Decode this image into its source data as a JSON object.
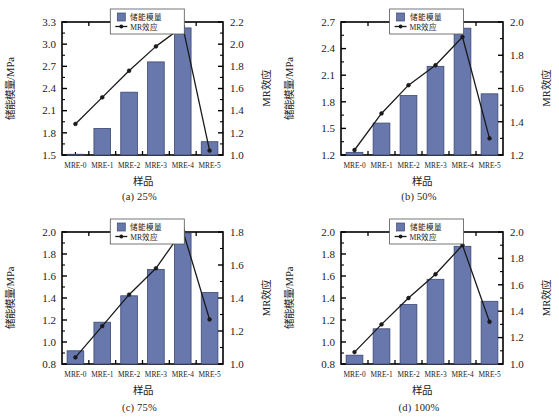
{
  "figure": {
    "panel_count": 4,
    "bar_color": "#6878AD",
    "bar_edge_color": "#3B4770",
    "line_color": "#1a1a1a",
    "axis_color": "#000000",
    "background": "#ffffff"
  },
  "legend": {
    "bar_label": "储能模量",
    "line_label": "MR效应"
  },
  "axes_titles": {
    "y_left": "储能模量/MPa",
    "y_right": "MR效应",
    "x": "样品"
  },
  "chart_data": [
    {
      "type": "bar",
      "id": "panel-a",
      "title": "(a) 25%",
      "caption": "(a) 25%",
      "xlabel": "样品",
      "ylabel": "储能模量/MPa",
      "y2label": "MR效应",
      "categories": [
        "MRE-0",
        "MRE-1",
        "MRE-2",
        "MRE-3",
        "MRE-4",
        "MRE-5"
      ],
      "ylim": [
        1.5,
        3.3
      ],
      "yticks": [
        "1.5",
        "1.8",
        "2.1",
        "2.4",
        "2.7",
        "3.0",
        "3.3"
      ],
      "y2lim": [
        1.0,
        2.2
      ],
      "y2ticks": [
        "1.0",
        "1.2",
        "1.4",
        "1.6",
        "1.8",
        "2.0",
        "2.2"
      ],
      "grid": false,
      "legend_position": "top-center",
      "series": [
        {
          "name": "储能模量",
          "kind": "bar",
          "axis": "left",
          "values": [
            1.51,
            1.86,
            2.35,
            2.76,
            3.22,
            1.68
          ]
        },
        {
          "name": "MR效应",
          "kind": "line",
          "axis": "right",
          "values": [
            1.28,
            1.52,
            1.76,
            1.98,
            2.16,
            1.04
          ]
        }
      ]
    },
    {
      "type": "bar",
      "id": "panel-b",
      "title": "(b) 50%",
      "caption": "(b) 50%",
      "xlabel": "样品",
      "ylabel": "储能模量/MPa",
      "y2label": "MR效应",
      "categories": [
        "MRE-0",
        "MRE-1",
        "MRE-2",
        "MRE-3",
        "MRE-4",
        "MRE-5"
      ],
      "ylim": [
        1.2,
        2.7
      ],
      "yticks": [
        "1.2",
        "1.5",
        "1.8",
        "2.1",
        "2.4",
        "2.7"
      ],
      "y2lim": [
        1.2,
        2.0
      ],
      "y2ticks": [
        "1.2",
        "1.4",
        "1.6",
        "1.8",
        "2.0"
      ],
      "grid": false,
      "legend_position": "top-center",
      "series": [
        {
          "name": "储能模量",
          "kind": "bar",
          "axis": "left",
          "values": [
            1.23,
            1.56,
            1.87,
            2.2,
            2.63,
            1.89
          ]
        },
        {
          "name": "MR效应",
          "kind": "line",
          "axis": "right",
          "values": [
            1.23,
            1.45,
            1.62,
            1.74,
            1.91,
            1.3
          ]
        }
      ]
    },
    {
      "type": "bar",
      "id": "panel-c",
      "title": "(c) 75%",
      "caption": "(c) 75%",
      "xlabel": "样品",
      "ylabel": "储能模量/MPa",
      "y2label": "MR效应",
      "categories": [
        "MRE-0",
        "MRE-1",
        "MRE-2",
        "MRE-3",
        "MRE-4",
        "MRE-5"
      ],
      "ylim": [
        0.8,
        2.0
      ],
      "yticks": [
        "0.8",
        "1.0",
        "1.2",
        "1.4",
        "1.6",
        "1.8",
        "2.0"
      ],
      "y2lim": [
        1.0,
        1.8
      ],
      "y2ticks": [
        "1.0",
        "1.2",
        "1.4",
        "1.6",
        "1.8"
      ],
      "grid": false,
      "legend_position": "top-center",
      "series": [
        {
          "name": "储能模量",
          "kind": "bar",
          "axis": "left",
          "values": [
            0.92,
            1.18,
            1.42,
            1.66,
            1.99,
            1.45
          ]
        },
        {
          "name": "MR效应",
          "kind": "line",
          "axis": "right",
          "values": [
            1.04,
            1.23,
            1.42,
            1.58,
            1.81,
            1.27
          ]
        }
      ]
    },
    {
      "type": "bar",
      "id": "panel-d",
      "title": "(d) 100%",
      "caption": "(d) 100%",
      "xlabel": "样品",
      "ylabel": "储能模量/MPa",
      "y2label": "MR效应",
      "categories": [
        "MRE-0",
        "MRE-1",
        "MRE-2",
        "MRE-3",
        "MRE-4",
        "MRE-5"
      ],
      "ylim": [
        0.8,
        2.0
      ],
      "yticks": [
        "0.8",
        "1.0",
        "1.2",
        "1.4",
        "1.6",
        "1.8",
        "2.0"
      ],
      "y2lim": [
        1.0,
        2.0
      ],
      "y2ticks": [
        "1.0",
        "1.2",
        "1.4",
        "1.6",
        "1.8",
        "2.0"
      ],
      "grid": false,
      "legend_position": "top-center",
      "series": [
        {
          "name": "储能模量",
          "kind": "bar",
          "axis": "left",
          "values": [
            0.88,
            1.12,
            1.34,
            1.57,
            1.87,
            1.37
          ]
        },
        {
          "name": "MR效应",
          "kind": "line",
          "axis": "right",
          "values": [
            1.09,
            1.3,
            1.5,
            1.68,
            1.9,
            1.32
          ]
        }
      ]
    }
  ]
}
